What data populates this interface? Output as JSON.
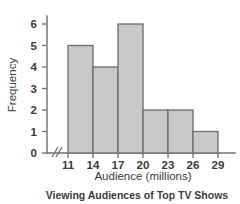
{
  "chart_data": {
    "type": "bar",
    "title": "",
    "caption": "Viewing Audiences of Top TV Shows",
    "xlabel": "Audience (millions)",
    "ylabel": "Frequency",
    "bin_edges": [
      11,
      14,
      17,
      20,
      23,
      26,
      29
    ],
    "categories": [
      "11-14",
      "14-17",
      "17-20",
      "20-23",
      "23-26",
      "26-29"
    ],
    "values": [
      5,
      4,
      6,
      2,
      2,
      1
    ],
    "x_tick_labels": [
      "11",
      "14",
      "17",
      "20",
      "23",
      "26",
      "29"
    ],
    "y_tick_labels": [
      "0",
      "1",
      "2",
      "3",
      "4",
      "5",
      "6"
    ],
    "ylim": [
      0,
      6.6
    ],
    "xlim": [
      11,
      29
    ],
    "grid": false,
    "legend": false,
    "axis_break": "//",
    "bar_fill_color": "#c9c9c9",
    "bar_stroke_color": "#6b6b6b",
    "axis_color": "#6f6f6f",
    "text_color": "#3b3b3b",
    "background_color": "#ffffff"
  },
  "yticks": [
    {
      "label": "6",
      "y": 24
    },
    {
      "label": "5",
      "y": 45.5
    },
    {
      "label": "4",
      "y": 67
    },
    {
      "label": "3",
      "y": 88.5
    },
    {
      "label": "2",
      "y": 110
    },
    {
      "label": "1",
      "y": 131.5
    },
    {
      "label": "0",
      "y": 153
    }
  ],
  "xticks": [
    {
      "label": "11",
      "x": 68
    },
    {
      "label": "14",
      "x": 93
    },
    {
      "label": "17",
      "x": 118
    },
    {
      "label": "20",
      "x": 143
    },
    {
      "label": "23",
      "x": 168
    },
    {
      "label": "26",
      "x": 193
    },
    {
      "label": "29",
      "x": 218
    }
  ],
  "bars": [
    {
      "label": "11-14",
      "value": "5",
      "x": 68,
      "w": 25,
      "y": 45.5,
      "h": 107.5
    },
    {
      "label": "14-17",
      "value": "4",
      "x": 93,
      "w": 25,
      "y": 67,
      "h": 86
    },
    {
      "label": "17-20",
      "value": "6",
      "x": 118,
      "w": 25,
      "y": 24,
      "h": 129
    },
    {
      "label": "20-23",
      "value": "2",
      "x": 143,
      "w": 25,
      "y": 110,
      "h": 43
    },
    {
      "label": "23-26",
      "value": "2",
      "x": 168,
      "w": 25,
      "y": 110,
      "h": 43
    },
    {
      "label": "26-29",
      "value": "1",
      "x": 193,
      "w": 25,
      "y": 131.5,
      "h": 21.5
    }
  ],
  "labels": {
    "ylabel": "Frequency",
    "xlabel": "Audience (millions)",
    "caption": "Viewing Audiences of Top TV Shows"
  }
}
